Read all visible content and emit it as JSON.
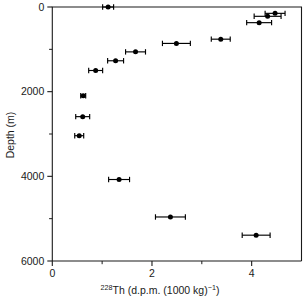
{
  "chart_data": {
    "type": "scatter",
    "title": "",
    "xlabel": "228Th (d.p.m. (1000 kg)-1)",
    "xlabel_parts": {
      "superscript": "228",
      "main": "Th (d.p.m. (1000 kg)",
      "exponent": "−1",
      "close": ")"
    },
    "ylabel": "Depth (m)",
    "xlim": [
      0,
      5.0
    ],
    "ylim": [
      0,
      6000
    ],
    "y_inverted": true,
    "grid": false,
    "legend": null,
    "x_ticks_major": [
      0,
      2,
      4
    ],
    "x_tick_labels": [
      "0",
      "2",
      "4"
    ],
    "x_ticks_minor": [
      1,
      3
    ],
    "y_ticks_major": [
      0,
      2000,
      4000,
      6000
    ],
    "y_tick_labels": [
      "0",
      "2000",
      "4000",
      "6000"
    ],
    "y_ticks_minor": [
      1000,
      3000,
      5000
    ],
    "marker_color": "#000000",
    "marker_shape": "circle",
    "series": [
      {
        "name": "228Th activity",
        "points": [
          {
            "x": 1.12,
            "depth": 0,
            "xerr": 0.11
          },
          {
            "x": 4.47,
            "depth": 150,
            "xerr": 0.2
          },
          {
            "x": 4.32,
            "depth": 220,
            "xerr": 0.27
          },
          {
            "x": 4.15,
            "depth": 370,
            "xerr": 0.25
          },
          {
            "x": 3.38,
            "depth": 760,
            "xerr": 0.19
          },
          {
            "x": 2.49,
            "depth": 860,
            "xerr": 0.28
          },
          {
            "x": 1.67,
            "depth": 1060,
            "xerr": 0.2
          },
          {
            "x": 1.27,
            "depth": 1270,
            "xerr": 0.16
          },
          {
            "x": 0.87,
            "depth": 1500,
            "xerr": 0.14
          },
          {
            "x": 0.62,
            "depth": 2095,
            "xerr": 0.05
          },
          {
            "x": 0.61,
            "depth": 2590,
            "xerr": 0.14
          },
          {
            "x": 0.54,
            "depth": 3040,
            "xerr": 0.09
          },
          {
            "x": 1.34,
            "depth": 4075,
            "xerr": 0.21
          },
          {
            "x": 2.37,
            "depth": 4960,
            "xerr": 0.3
          },
          {
            "x": 4.09,
            "depth": 5390,
            "xerr": 0.28
          }
        ]
      }
    ]
  },
  "figure": {
    "background": "#ffffff",
    "frame_color": "#1a1a1a"
  }
}
